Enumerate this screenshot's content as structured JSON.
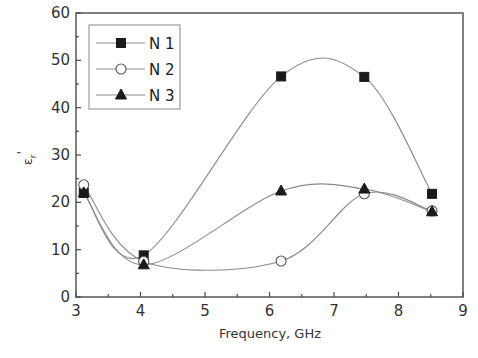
{
  "chart_data": {
    "type": "line",
    "title": "",
    "xlabel": "Frequency, GHz",
    "ylabel": "εr'",
    "ylabel_main": "ε",
    "ylabel_sub": "r",
    "ylabel_prime": "'",
    "xlim": [
      3,
      9
    ],
    "ylim": [
      0,
      60
    ],
    "xticks": [
      3,
      4,
      5,
      6,
      7,
      8,
      9
    ],
    "yticks": [
      0,
      10,
      20,
      30,
      40,
      50,
      60
    ],
    "grid": false,
    "legend_position": "upper-left",
    "smooth": true,
    "series": [
      {
        "name": "N 1",
        "marker": "filled-square",
        "x": [
          3.12,
          4.05,
          6.18,
          7.47,
          8.52
        ],
        "y": [
          22.0,
          8.8,
          46.6,
          46.5,
          21.8
        ]
      },
      {
        "name": "N 2",
        "marker": "open-circle",
        "x": [
          3.12,
          4.05,
          6.18,
          7.47,
          8.52
        ],
        "y": [
          23.7,
          7.5,
          7.6,
          21.8,
          18.2
        ]
      },
      {
        "name": "N 3",
        "marker": "filled-triangle",
        "x": [
          3.12,
          4.05,
          6.18,
          7.47,
          8.52
        ],
        "y": [
          22.0,
          6.8,
          22.4,
          22.8,
          18.0
        ]
      }
    ]
  },
  "legend": {
    "items": [
      {
        "label": "N 1",
        "marker": "filled-square"
      },
      {
        "label": "N 2",
        "marker": "open-circle"
      },
      {
        "label": "N 3",
        "marker": "filled-triangle"
      }
    ]
  },
  "colors": {
    "axis": "#4a4a4a",
    "curve": "#8a8a8a",
    "marker_fill": "#1a1a1a",
    "text": "#333333"
  }
}
